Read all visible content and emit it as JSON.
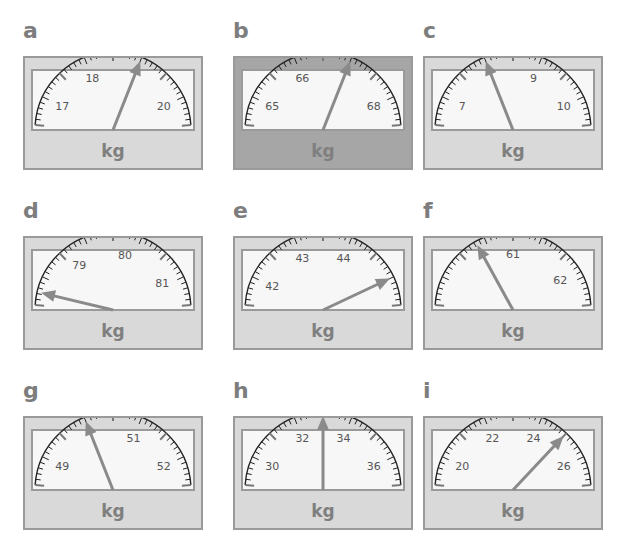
{
  "unit_label": "kg",
  "colors": {
    "frame": "#d9d9d9",
    "frame_dark": "#a6a6a6",
    "dial": "#f7f7f7",
    "needle": "#8a8a8a",
    "text": "#7d7d7d"
  },
  "gauges": [
    {
      "letter": "a",
      "labels": [
        "17",
        "18",
        "20"
      ],
      "frame": "light",
      "label_values": [
        17,
        18,
        20
      ],
      "range": [
        16.5,
        20.5
      ],
      "needle_value": 19
    },
    {
      "letter": "b",
      "labels": [
        "65",
        "66",
        "68"
      ],
      "frame": "dark",
      "label_values": [
        65,
        66,
        68
      ],
      "range": [
        64.5,
        68.5
      ],
      "needle_value": 67
    },
    {
      "letter": "c",
      "labels": [
        "7",
        "9",
        "10"
      ],
      "frame": "light",
      "label_values": [
        7,
        9,
        10
      ],
      "range": [
        6.5,
        10.5
      ],
      "needle_value": 8
    },
    {
      "letter": "d",
      "labels": [
        "79",
        "80",
        "81"
      ],
      "frame": "light",
      "label_values": [
        79,
        80,
        81
      ],
      "range": [
        78,
        81.5
      ],
      "needle_value": 78.2
    },
    {
      "letter": "e",
      "labels": [
        "42",
        "43",
        "44"
      ],
      "frame": "light",
      "label_values": [
        42,
        43,
        44
      ],
      "range": [
        41.5,
        45.5
      ],
      "needle_value": 45
    },
    {
      "letter": "f",
      "labels": [
        "61",
        "62"
      ],
      "frame": "light",
      "label_values": [
        61,
        62
      ],
      "range": [
        59.5,
        62.5
      ],
      "needle_value": 60.5
    },
    {
      "letter": "g",
      "labels": [
        "49",
        "51",
        "52"
      ],
      "frame": "light",
      "label_values": [
        49,
        51,
        52
      ],
      "range": [
        48.5,
        52.5
      ],
      "needle_value": 50
    },
    {
      "letter": "h",
      "labels": [
        "30",
        "32",
        "34",
        "36"
      ],
      "frame": "light",
      "label_values": [
        30,
        32,
        34,
        36
      ],
      "range": [
        29,
        37
      ],
      "needle_value": 33
    },
    {
      "letter": "i",
      "labels": [
        "20",
        "22",
        "24",
        "26"
      ],
      "frame": "light",
      "label_values": [
        20,
        22,
        24,
        26
      ],
      "range": [
        19,
        27
      ],
      "needle_value": 25
    }
  ]
}
